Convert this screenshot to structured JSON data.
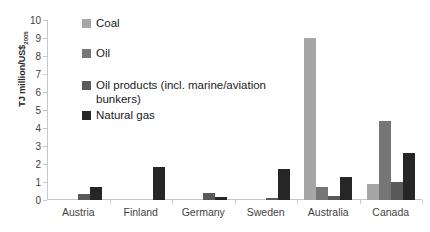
{
  "chart_data": {
    "type": "bar",
    "title": "",
    "subtitle": "",
    "xlabel": "",
    "ylabel": "TJ million/US$2005",
    "ylabel_base": "TJ million/US$",
    "ylabel_sub": "2005",
    "categories": [
      "Austria",
      "Finland",
      "Germany",
      "Sweden",
      "Australia",
      "Canada"
    ],
    "ylim": [
      0,
      10
    ],
    "yticks": [
      0,
      1,
      2,
      3,
      4,
      5,
      6,
      7,
      8,
      9,
      10
    ],
    "ytick_labels": [
      "0",
      "1",
      "2",
      "3",
      "4",
      "5",
      "6",
      "7",
      "8",
      "9",
      "10"
    ],
    "grid": false,
    "legend_position": "upper-left-inside",
    "series": [
      {
        "name": "Coal",
        "color": "#A6A6A6",
        "values": [
          0,
          0,
          0,
          0,
          9.0,
          0.9
        ]
      },
      {
        "name": "Oil",
        "color": "#767676",
        "values": [
          0,
          0,
          0,
          0,
          0.7,
          4.4
        ]
      },
      {
        "name": "Oil products (incl. marine/aviation bunkers)",
        "color": "#595959",
        "values": [
          0.35,
          0,
          0.4,
          0.1,
          0.25,
          1.0
        ]
      },
      {
        "name": "Natural gas",
        "color": "#262626",
        "values": [
          0.7,
          1.85,
          0.15,
          1.7,
          1.3,
          2.6
        ]
      }
    ]
  },
  "legend": {
    "items": [
      {
        "label": "Coal"
      },
      {
        "label": "Oil"
      },
      {
        "label": "Oil products (incl. marine/aviation\nbunkers)"
      },
      {
        "label": "Natural gas"
      }
    ]
  },
  "colors": {
    "axis": "#c8c8c8",
    "tick_text": "#3f3f3f",
    "legend_text": "#1a1a1a",
    "background": "#ffffff"
  }
}
